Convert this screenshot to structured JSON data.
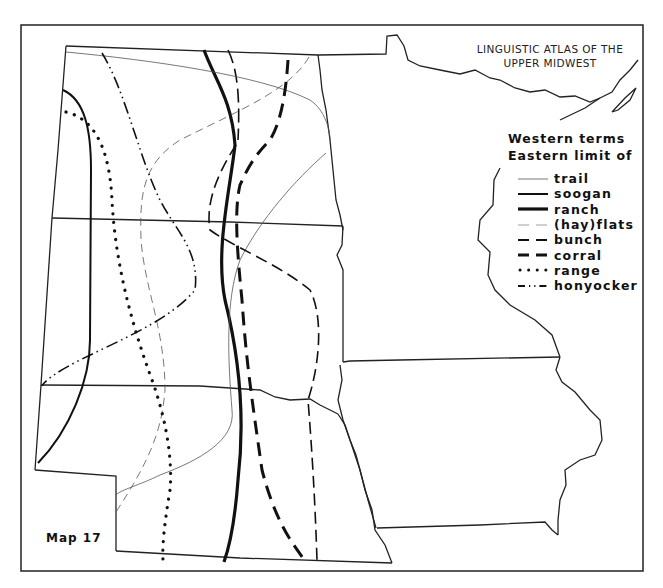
{
  "map": {
    "title_line1": "LINGUISTIC ATLAS OF THE",
    "title_line2": "UPPER MIDWEST",
    "map_number_label": "Map 17",
    "legend": {
      "heading_line1": "Western terms",
      "heading_line2": "Eastern limit of",
      "items": [
        {
          "label": "trail",
          "style": "thin-solid"
        },
        {
          "label": "soogan",
          "style": "medium-solid"
        },
        {
          "label": "ranch",
          "style": "heavy-solid"
        },
        {
          "label": "(hay)flats",
          "style": "thin-dashed"
        },
        {
          "label": "bunch",
          "style": "medium-dashed"
        },
        {
          "label": "corral",
          "style": "heavy-dashed"
        },
        {
          "label": "range",
          "style": "dotted"
        },
        {
          "label": "honyocker",
          "style": "dash-dot-dot"
        }
      ]
    },
    "colors": {
      "ink": "#111111",
      "background": "#ffffff",
      "light_line": "#777777"
    }
  }
}
